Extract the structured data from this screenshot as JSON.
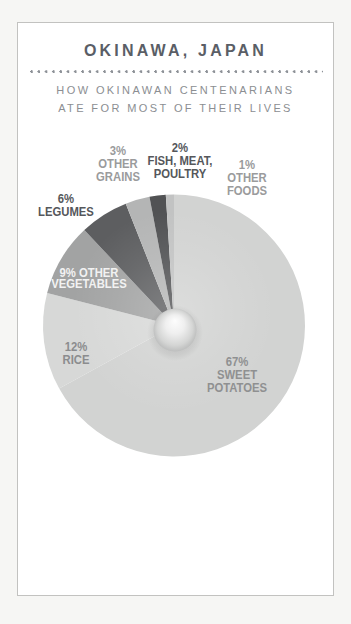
{
  "card": {
    "title": "OKINAWA, JAPAN",
    "subtitle_line1": "HOW OKINAWAN CENTENARIANS",
    "subtitle_line2": "ATE FOR MOST OF THEIR LIVES"
  },
  "chart_data": {
    "type": "pie",
    "title": "OKINAWA, JAPAN",
    "subtitle": "HOW OKINAWAN CENTENARIANS ATE FOR MOST OF THEIR LIVES",
    "start_angle_deg": 0,
    "direction": "clockwise",
    "donut_center": "small sphere hub",
    "segments": [
      {
        "id": "sweet-potatoes",
        "label": "SWEET POTATOES",
        "pct": 67,
        "color": "#d2d3d2"
      },
      {
        "id": "rice",
        "label": "RICE",
        "pct": 12,
        "color": "#d7d8d7"
      },
      {
        "id": "other-vegetables",
        "label": "OTHER VEGETABLES",
        "pct": 9,
        "color": "#a2a3a3"
      },
      {
        "id": "legumes",
        "label": "LEGUMES",
        "pct": 6,
        "color": "#5d5e60"
      },
      {
        "id": "other-grains",
        "label": "OTHER GRAINS",
        "pct": 3,
        "color": "#b4b5b5"
      },
      {
        "id": "fish-meat-poultry",
        "label": "FISH, MEAT, POULTRY",
        "pct": 2,
        "color": "#515254"
      },
      {
        "id": "other-foods",
        "label": "OTHER FOODS",
        "pct": 1,
        "color": "#c2c3c3"
      }
    ]
  },
  "labels": {
    "grains": [
      "3%",
      "OTHER",
      "GRAINS"
    ],
    "fish": [
      "2%",
      "FISH, MEAT,",
      "POULTRY"
    ],
    "foods": [
      "1%",
      "OTHER",
      "FOODS"
    ],
    "legumes": [
      "6%",
      "LEGUMES"
    ],
    "vegetables": [
      "9% OTHER",
      "VEGETABLES"
    ],
    "rice": [
      "12%",
      "RICE"
    ],
    "sweet_potatoes": [
      "67%",
      "SWEET",
      "POTATOES"
    ]
  },
  "colors": {
    "page_background": "#f6f6f4",
    "card_background": "#ffffff",
    "card_border": "#c2c2c0",
    "title_text": "#5a5e66",
    "subtitle_text": "#8b8e92",
    "dark_label": "#55575b",
    "gray_label": "#9a9b9c",
    "white_label": "#f2f2f2"
  }
}
